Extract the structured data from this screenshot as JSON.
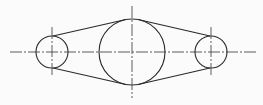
{
  "diagram": {
    "type": "belt-pulley-drawing",
    "stroke_color": "#2a2a2a",
    "centerline_color": "#4a4a4a",
    "background": "#fbfbfb",
    "centerline_y": 52,
    "horizontal_centerline": {
      "x1": 10,
      "x2": 256
    },
    "circles": [
      {
        "name": "left-pulley",
        "cx": 52,
        "cy": 52,
        "r": 16,
        "vline": {
          "y1": 27,
          "y2": 76
        }
      },
      {
        "name": "center-pulley",
        "cx": 132,
        "cy": 52,
        "r": 33,
        "vline": {
          "y1": 6,
          "y2": 98
        }
      },
      {
        "name": "right-pulley",
        "cx": 211,
        "cy": 52,
        "r": 16,
        "vline": {
          "y1": 27,
          "y2": 77
        }
      }
    ],
    "tangent_lines": [
      {
        "name": "upper-left-belt",
        "x1": 53,
        "y1": 36,
        "x2": 126,
        "y2": 19.5
      },
      {
        "name": "lower-left-belt",
        "x1": 53,
        "y1": 68,
        "x2": 126,
        "y2": 84.5
      },
      {
        "name": "upper-right-belt",
        "x1": 138,
        "y1": 19.5,
        "x2": 210,
        "y2": 36
      },
      {
        "name": "lower-right-belt",
        "x1": 138,
        "y1": 84.5,
        "x2": 210,
        "y2": 68
      }
    ]
  }
}
